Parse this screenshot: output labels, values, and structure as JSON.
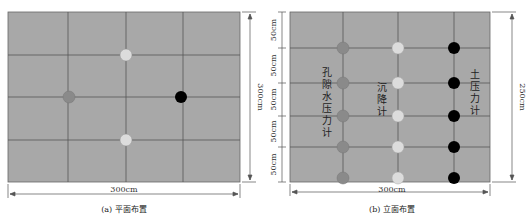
{
  "colors": {
    "background": "#a8a8a8",
    "grid": "#555555",
    "pore_pressure": "#8a8a8a",
    "settlement": "#dcdcdc",
    "earth_pressure": "#000000",
    "dimension": "#555555"
  },
  "plan": {
    "caption": "(a) 平面布置",
    "width_label": "300cm",
    "height_label": "300cm",
    "points": [
      {
        "name": "settlement-top",
        "type": "settlement"
      },
      {
        "name": "pore-left",
        "type": "pore_pressure"
      },
      {
        "name": "earth-right",
        "type": "earth_pressure"
      },
      {
        "name": "settlement-bottom",
        "type": "settlement"
      }
    ]
  },
  "elevation": {
    "caption": "(b) 立面布置",
    "width_label": "300cm",
    "height_label": "250cm",
    "spacing_labels": [
      "50cm",
      "50cm",
      "50cm",
      "50cm",
      "50cm"
    ],
    "columns": [
      {
        "label": "孔隙水压力计",
        "type": "pore_pressure",
        "count": 5
      },
      {
        "label": "沉降计",
        "type": "settlement",
        "count": 5
      },
      {
        "label": "土压力计",
        "type": "earth_pressure",
        "count": 5
      }
    ]
  }
}
